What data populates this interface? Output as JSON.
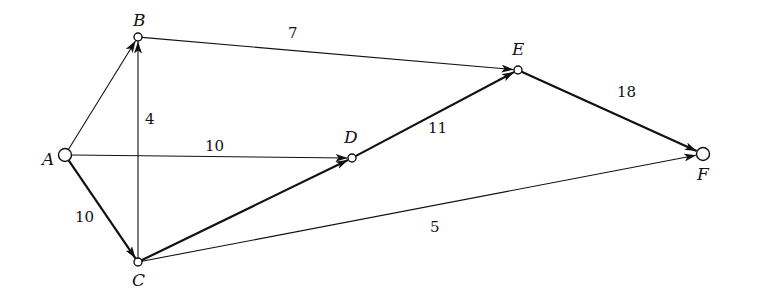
{
  "diagram": {
    "type": "directed-weighted-network",
    "nodes": [
      {
        "id": "A",
        "label": "A",
        "x": 65,
        "y": 155,
        "r": 6.5,
        "label_x": 42,
        "label_y": 165
      },
      {
        "id": "B",
        "label": "B",
        "x": 138,
        "y": 37,
        "r": 4,
        "label_x": 133,
        "label_y": 26
      },
      {
        "id": "C",
        "label": "C",
        "x": 138,
        "y": 262,
        "r": 4,
        "label_x": 132,
        "label_y": 286
      },
      {
        "id": "D",
        "label": "D",
        "x": 352,
        "y": 158,
        "r": 4,
        "label_x": 344,
        "label_y": 143
      },
      {
        "id": "E",
        "label": "E",
        "x": 518,
        "y": 70,
        "r": 4,
        "label_x": 512,
        "label_y": 55
      },
      {
        "id": "F",
        "label": "F",
        "x": 703,
        "y": 154,
        "r": 6.5,
        "label_x": 697,
        "label_y": 180
      }
    ],
    "edges": [
      {
        "from": "A",
        "to": "B",
        "weight": "",
        "bold": false
      },
      {
        "from": "B",
        "to": "E",
        "weight": "7",
        "bold": false,
        "label_x": 288,
        "label_y": 38
      },
      {
        "from": "C",
        "to": "B",
        "weight": "4",
        "bold": false,
        "label_x": 145,
        "label_y": 124
      },
      {
        "from": "A",
        "to": "D",
        "weight": "10",
        "bold": false,
        "label_x": 205,
        "label_y": 151
      },
      {
        "from": "A",
        "to": "C",
        "weight": "10",
        "bold": true,
        "label_x": 75,
        "label_y": 222
      },
      {
        "from": "C",
        "to": "D",
        "weight": "",
        "bold": true
      },
      {
        "from": "D",
        "to": "E",
        "weight": "11",
        "bold": true,
        "label_x": 428,
        "label_y": 133
      },
      {
        "from": "E",
        "to": "F",
        "weight": "18",
        "bold": true,
        "label_x": 617,
        "label_y": 97
      },
      {
        "from": "C",
        "to": "F",
        "weight": "5",
        "bold": false,
        "label_x": 430,
        "label_y": 232
      }
    ],
    "colors": {
      "stroke": "#111111",
      "background": "#ffffff"
    }
  }
}
